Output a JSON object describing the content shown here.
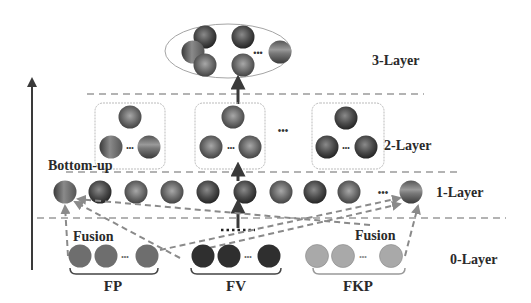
{
  "diagram": {
    "layers": {
      "layer3": "3-Layer",
      "layer2": "2-Layer",
      "layer1": "1-Layer",
      "layer0": "0-Layer"
    },
    "direction_label": "Bottom-up",
    "fusion_labels": [
      "Fusion",
      "Fusion"
    ],
    "groups": [
      {
        "id": "fp",
        "label": "FP",
        "color": "#6e6e6e"
      },
      {
        "id": "fv",
        "label": "FV",
        "color": "#2f2f2f"
      },
      {
        "id": "fkp",
        "label": "FKP",
        "color": "#a9a9a9"
      }
    ],
    "ellipsis": "•••",
    "colors": {
      "line": "#8a8a8a",
      "arrow": "#3a3a3a",
      "box_border": "#b5b5b5",
      "text": "#2a2a2a"
    }
  }
}
